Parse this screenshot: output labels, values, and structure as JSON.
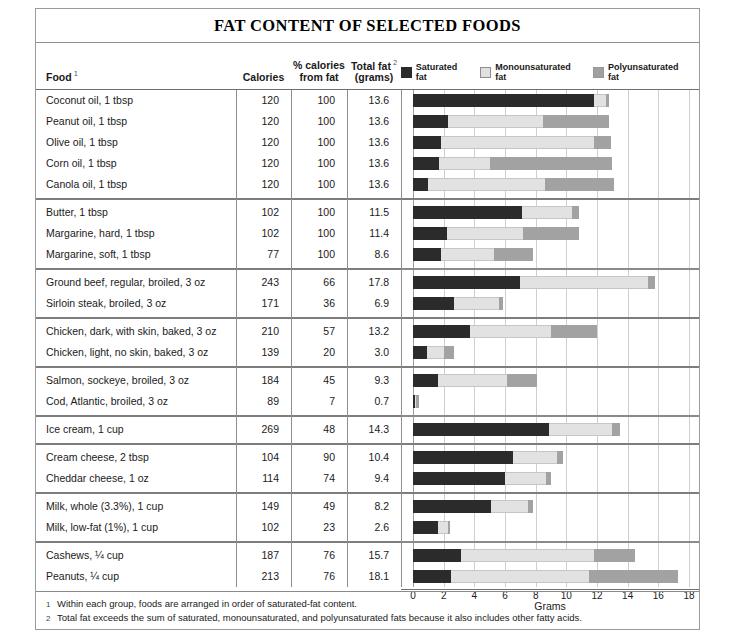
{
  "title": "FAT CONTENT OF SELECTED FOODS",
  "columns": {
    "food": "Food",
    "food_note": "1",
    "calories": "Calories",
    "pct_line1": "% calories",
    "pct_line2": "from fat",
    "total_line1": "Total fat",
    "total_note": "2",
    "total_line2": "(grams)"
  },
  "legend": [
    {
      "label": "Saturated fat",
      "swatch": "sat",
      "color": "#2b2b2b"
    },
    {
      "label": "Monounsaturated fat",
      "swatch": "mono",
      "color": "#e2e2e2"
    },
    {
      "label": "Polyunsaturated fat",
      "swatch": "poly",
      "color": "#a2a2a2"
    }
  ],
  "axis": {
    "label": "Grams",
    "ticks": [
      0,
      2,
      4,
      6,
      8,
      10,
      12,
      14,
      16,
      18
    ],
    "min": 0,
    "max": 18
  },
  "footnotes": [
    {
      "marker": "1",
      "text": "Within each group, foods are arranged in order of saturated-fat content."
    },
    {
      "marker": "2",
      "text": "Total fat exceeds the sum of saturated, monounsaturated, and polyunsaturated fats because it also includes other fatty acids."
    }
  ],
  "chart_data": {
    "type": "bar",
    "orientation": "horizontal",
    "stacked": true,
    "title": "FAT CONTENT OF SELECTED FOODS",
    "xlabel": "Grams",
    "ylabel": "",
    "xlim": [
      0,
      18
    ],
    "grid": true,
    "legend_position": "top-right",
    "series": [
      {
        "name": "Saturated fat",
        "color": "#2b2b2b"
      },
      {
        "name": "Monounsaturated fat",
        "color": "#e2e2e2"
      },
      {
        "name": "Polyunsaturated fat",
        "color": "#a2a2a2"
      }
    ],
    "groups": [
      {
        "rows": [
          {
            "food": "Coconut oil, 1 tbsp",
            "calories": "120",
            "pct_from_fat": "100",
            "total_fat": "13.6",
            "saturated": 11.8,
            "monounsaturated": 0.8,
            "polyunsaturated": 0.2
          },
          {
            "food": "Peanut oil, 1 tbsp",
            "calories": "120",
            "pct_from_fat": "100",
            "total_fat": "13.6",
            "saturated": 2.3,
            "monounsaturated": 6.2,
            "polyunsaturated": 4.3
          },
          {
            "food": "Olive oil, 1 tbsp",
            "calories": "120",
            "pct_from_fat": "100",
            "total_fat": "13.6",
            "saturated": 1.8,
            "monounsaturated": 10.0,
            "polyunsaturated": 1.1
          },
          {
            "food": "Corn oil, 1 tbsp",
            "calories": "120",
            "pct_from_fat": "100",
            "total_fat": "13.6",
            "saturated": 1.7,
            "monounsaturated": 3.3,
            "polyunsaturated": 8.0
          },
          {
            "food": "Canola oil, 1 tbsp",
            "calories": "120",
            "pct_from_fat": "100",
            "total_fat": "13.6",
            "saturated": 1.0,
            "monounsaturated": 7.6,
            "polyunsaturated": 4.5
          }
        ]
      },
      {
        "rows": [
          {
            "food": "Butter, 1 tbsp",
            "calories": "102",
            "pct_from_fat": "100",
            "total_fat": "11.5",
            "saturated": 7.1,
            "monounsaturated": 3.3,
            "polyunsaturated": 0.4
          },
          {
            "food": "Margarine, hard, 1 tbsp",
            "calories": "102",
            "pct_from_fat": "100",
            "total_fat": "11.4",
            "saturated": 2.2,
            "monounsaturated": 5.0,
            "polyunsaturated": 3.6
          },
          {
            "food": "Margarine, soft, 1 tbsp",
            "calories": "77",
            "pct_from_fat": "100",
            "total_fat": "8.6",
            "saturated": 1.8,
            "monounsaturated": 3.5,
            "polyunsaturated": 2.5
          }
        ]
      },
      {
        "rows": [
          {
            "food": "Ground beef, regular, broiled, 3 oz",
            "calories": "243",
            "pct_from_fat": "66",
            "total_fat": "17.8",
            "saturated": 7.0,
            "monounsaturated": 8.3,
            "polyunsaturated": 0.5
          },
          {
            "food": "Sirloin steak, broiled, 3 oz",
            "calories": "171",
            "pct_from_fat": "36",
            "total_fat": "6.9",
            "saturated": 2.7,
            "monounsaturated": 2.9,
            "polyunsaturated": 0.3
          }
        ]
      },
      {
        "rows": [
          {
            "food": "Chicken, dark, with skin, baked, 3 oz",
            "calories": "210",
            "pct_from_fat": "57",
            "total_fat": "13.2",
            "saturated": 3.7,
            "monounsaturated": 5.3,
            "polyunsaturated": 3.0
          },
          {
            "food": "Chicken, light, no skin, baked, 3 oz",
            "calories": "139",
            "pct_from_fat": "20",
            "total_fat": "3.0",
            "saturated": 0.9,
            "monounsaturated": 1.1,
            "polyunsaturated": 0.7
          }
        ]
      },
      {
        "rows": [
          {
            "food": "Salmon, sockeye, broiled, 3 oz",
            "calories": "184",
            "pct_from_fat": "45",
            "total_fat": "9.3",
            "saturated": 1.6,
            "monounsaturated": 4.5,
            "polyunsaturated": 2.0
          },
          {
            "food": "Cod, Atlantic, broiled, 3 oz",
            "calories": "89",
            "pct_from_fat": "7",
            "total_fat": "0.7",
            "saturated": 0.1,
            "monounsaturated": 0.1,
            "polyunsaturated": 0.2
          }
        ]
      },
      {
        "rows": [
          {
            "food": "Ice cream, 1 cup",
            "calories": "269",
            "pct_from_fat": "48",
            "total_fat": "14.3",
            "saturated": 8.9,
            "monounsaturated": 4.1,
            "polyunsaturated": 0.5
          }
        ]
      },
      {
        "rows": [
          {
            "food": "Cream cheese, 2 tbsp",
            "calories": "104",
            "pct_from_fat": "90",
            "total_fat": "10.4",
            "saturated": 6.5,
            "monounsaturated": 2.9,
            "polyunsaturated": 0.4
          },
          {
            "food": "Cheddar cheese, 1 oz",
            "calories": "114",
            "pct_from_fat": "74",
            "total_fat": "9.4",
            "saturated": 6.0,
            "monounsaturated": 2.7,
            "polyunsaturated": 0.3
          }
        ]
      },
      {
        "rows": [
          {
            "food": "Milk, whole (3.3%), 1 cup",
            "calories": "149",
            "pct_from_fat": "49",
            "total_fat": "8.2",
            "saturated": 5.1,
            "monounsaturated": 2.4,
            "polyunsaturated": 0.3
          },
          {
            "food": "Milk, low-fat (1%), 1 cup",
            "calories": "102",
            "pct_from_fat": "23",
            "total_fat": "2.6",
            "saturated": 1.6,
            "monounsaturated": 0.7,
            "polyunsaturated": 0.1
          }
        ]
      },
      {
        "rows": [
          {
            "food": "Cashews, ¼ cup",
            "calories": "187",
            "pct_from_fat": "76",
            "total_fat": "15.7",
            "saturated": 3.1,
            "monounsaturated": 8.7,
            "polyunsaturated": 2.7
          },
          {
            "food": "Peanuts, ¼ cup",
            "calories": "213",
            "pct_from_fat": "76",
            "total_fat": "18.1",
            "saturated": 2.5,
            "monounsaturated": 9.0,
            "polyunsaturated": 5.8
          }
        ]
      }
    ]
  }
}
